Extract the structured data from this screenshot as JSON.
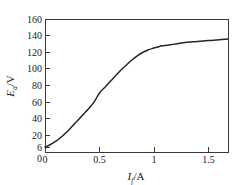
{
  "figure": {
    "background_color": "#ffffff",
    "frame_color": "#3a3a3a",
    "curve_color": "#262626"
  },
  "chart_data": {
    "type": "line",
    "title": "",
    "subtitle": "",
    "xlabel": "I_f/A",
    "xlabel_symbol": "I",
    "xlabel_subscript": "f",
    "xlabel_unit": "/A",
    "ylabel": "E_a/V",
    "ylabel_symbol": "E",
    "ylabel_subscript": "a",
    "ylabel_unit": "/V",
    "xlim": [
      0,
      1.68
    ],
    "ylim": [
      0,
      160
    ],
    "grid": false,
    "legend": false,
    "legend_position": "none",
    "xticks": [
      0,
      0.5,
      1,
      1.5
    ],
    "xticklabels": [
      "0",
      "0.5",
      "1",
      "1.5"
    ],
    "yticks": [
      0,
      6,
      20,
      40,
      60,
      80,
      100,
      120,
      140,
      160
    ],
    "yticklabels": [
      "0",
      "6",
      "20",
      "40",
      "60",
      "80",
      "100",
      "120",
      "140",
      "160"
    ],
    "series": [
      {
        "name": "open-circuit characteristic",
        "x": [
          0.0,
          0.05,
          0.1,
          0.15,
          0.2,
          0.25,
          0.3,
          0.35,
          0.4,
          0.45,
          0.5,
          0.55,
          0.6,
          0.65,
          0.7,
          0.75,
          0.8,
          0.85,
          0.9,
          0.95,
          1.0,
          1.05,
          1.1,
          1.15,
          1.2,
          1.25,
          1.3,
          1.35,
          1.4,
          1.45,
          1.5,
          1.55,
          1.6,
          1.65,
          1.68
        ],
        "y": [
          6,
          9,
          13,
          18,
          24,
          31,
          38,
          45,
          52,
          60,
          71,
          78,
          85,
          92,
          99,
          105,
          111,
          116,
          120,
          123,
          125,
          127,
          128,
          129,
          130,
          131,
          132,
          132.5,
          133,
          133.5,
          134,
          134.5,
          135,
          135.5,
          136
        ]
      }
    ],
    "annotations": [
      {
        "label": "6",
        "meaning": "residual-voltage-intercept",
        "x": 0,
        "y": 6
      }
    ]
  }
}
